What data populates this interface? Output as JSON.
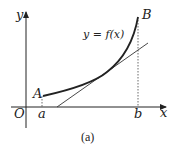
{
  "diagram": {
    "axes": {
      "x_label": "x",
      "y_label": "y",
      "origin_label": "O"
    },
    "points": {
      "A": "A",
      "B": "B"
    },
    "ticks": {
      "a": "a",
      "b": "b"
    },
    "curve_label": "y = f(x)",
    "caption": "(a)",
    "colors": {
      "stroke": "#222222",
      "background": "#ffffff"
    }
  }
}
